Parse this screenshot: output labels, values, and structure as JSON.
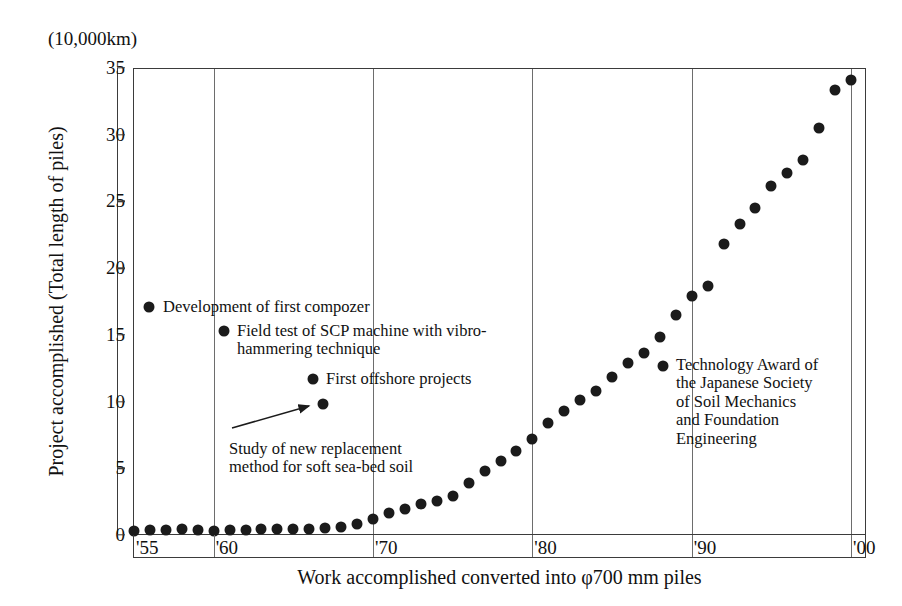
{
  "chart_data": {
    "type": "scatter",
    "title": "",
    "unit_note": "(10,000km)",
    "xlabel": "Work accomplished converted into φ700 mm piles",
    "ylabel": "Project accomplished (Total length of piles)",
    "xlim": [
      1955,
      2001
    ],
    "ylim": [
      0,
      35
    ],
    "ytick_labels": [
      "0",
      "5",
      "10",
      "15",
      "20",
      "25",
      "30",
      "35"
    ],
    "ytick_values": [
      0,
      5,
      10,
      15,
      20,
      25,
      30,
      35
    ],
    "xtick_labels": [
      "'55",
      "'60",
      "'70",
      "'80",
      "'90",
      "'00"
    ],
    "xtick_values": [
      1955,
      1960,
      1970,
      1980,
      1990,
      2000
    ],
    "grid": "vertical",
    "legend": "none",
    "x": [
      1955,
      1956,
      1957,
      1958,
      1959,
      1960,
      1961,
      1962,
      1963,
      1964,
      1965,
      1966,
      1967,
      1968,
      1969,
      1970,
      1971,
      1972,
      1973,
      1974,
      1975,
      1976,
      1977,
      1978,
      1979,
      1980,
      1981,
      1982,
      1983,
      1984,
      1985,
      1986,
      1987,
      1988,
      1989,
      1990,
      1991,
      1992,
      1993,
      1994,
      1995,
      1996,
      1997,
      1998,
      1999,
      2000
    ],
    "values": [
      0.4,
      0.45,
      0.45,
      0.55,
      0.45,
      0.4,
      0.45,
      0.45,
      0.5,
      0.5,
      0.55,
      0.55,
      0.6,
      0.65,
      0.9,
      1.3,
      1.7,
      2.0,
      2.4,
      2.6,
      3.0,
      4.0,
      4.9,
      5.6,
      6.4,
      7.3,
      8.5,
      9.4,
      10.2,
      10.9,
      11.9,
      13.0,
      13.7,
      14.9,
      16.6,
      18.0,
      18.7,
      21.9,
      23.4,
      24.6,
      26.2,
      27.2,
      28.2,
      30.6,
      33.4,
      34.2
    ],
    "marker": "filled-circle",
    "marker_color": "#1b1b1b"
  },
  "annotations": [
    {
      "id": "development-first-compozer",
      "text": "Development of first compozer",
      "bullet_x_px": 149,
      "bullet_y_px": 307,
      "text_x_px": 163,
      "text_y_px": 298
    },
    {
      "id": "field-test-scp-machine",
      "text": "Field test of SCP machine with vibro-\nhammering technique",
      "bullet_x_px": 224,
      "bullet_y_px": 331,
      "text_x_px": 237,
      "text_y_px": 322
    },
    {
      "id": "first-offshore-projects",
      "text": "First offshore projects",
      "bullet_x_px": 313,
      "bullet_y_px": 379,
      "text_x_px": 326,
      "text_y_px": 370
    },
    {
      "id": "study-new-replacement-method",
      "text": "Study of new replacement\nmethod for soft sea-bed soil",
      "bullet_x_px": 323,
      "bullet_y_px": 404,
      "text_x_px": 229,
      "text_y_px": 440
    },
    {
      "id": "technology-award",
      "text": "Technology Award of\nthe Japanese Society\nof Soil Mechanics\nand Foundation\nEngineering",
      "bullet_x_px": 663,
      "bullet_y_px": 366,
      "text_x_px": 676,
      "text_y_px": 356
    }
  ],
  "axes_geometry": {
    "plot_left_px": 133,
    "plot_top_px": 68,
    "plot_width_px": 733,
    "plot_height_px": 467
  }
}
